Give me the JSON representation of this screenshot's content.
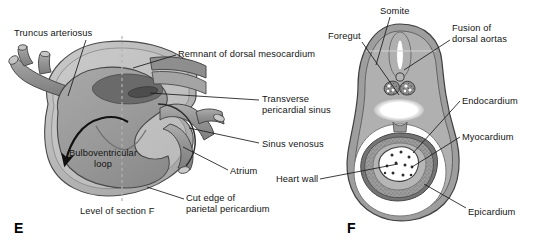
{
  "figure": {
    "background_color": "#ffffff",
    "width": 543,
    "height": 251
  },
  "palette": {
    "outline": "#3b3b3b",
    "leader_line": "#1a1a1a",
    "text": "#141414",
    "tissue_mid": "#9a9a9a",
    "tissue_light": "#b9b9b9",
    "tissue_lighter": "#cfcfcf",
    "tissue_dark": "#6e6e6e",
    "tissue_darker": "#5a5a5a",
    "lumen_white": "#ffffff",
    "pericardium_overlay": "#c4c4c4",
    "dashed_axis": "#b0b0b0"
  },
  "panels": [
    {
      "id": "E",
      "letter": "E",
      "x": 14,
      "y": 221
    },
    {
      "id": "F",
      "letter": "F",
      "x": 347,
      "y": 221
    }
  ],
  "labels": [
    {
      "id": "truncus-arteriosus",
      "text": "Truncus arteriosus",
      "x": 14,
      "y": 28,
      "align": "left",
      "panel": "E",
      "leader": [
        [
          86,
          40
        ],
        [
          68,
          96
        ]
      ]
    },
    {
      "id": "remnant-of-dorsal-mesocardium",
      "text": "Remnant of dorsal mesocardium",
      "x": 178,
      "y": 49,
      "align": "left",
      "panel": "E",
      "leader": [
        [
          176,
          55
        ],
        [
          133,
          68
        ]
      ]
    },
    {
      "id": "transverse-pericardial-sinus",
      "text": "Transverse\npericardial sinus",
      "x": 262,
      "y": 94,
      "align": "left",
      "panel": "E",
      "leader": [
        [
          259,
          100
        ],
        [
          150,
          93
        ]
      ]
    },
    {
      "id": "sinus-venosus",
      "text": "Sinus venosus",
      "x": 262,
      "y": 139,
      "align": "left",
      "panel": "E",
      "leader": [
        [
          259,
          143
        ],
        [
          189,
          128
        ]
      ]
    },
    {
      "id": "atrium",
      "text": "Atrium",
      "x": 230,
      "y": 166,
      "align": "left",
      "panel": "E",
      "leader": [
        [
          228,
          170
        ],
        [
          183,
          147
        ]
      ]
    },
    {
      "id": "cut-edge-of-parietal-pericardium",
      "text": "Cut edge of\nparietal pericardium",
      "x": 186,
      "y": 193,
      "align": "left",
      "panel": "E",
      "leader": [
        [
          184,
          199
        ],
        [
          147,
          187
        ]
      ]
    },
    {
      "id": "bulboventricular-loop",
      "text": "Bulboventricular\nloop",
      "x": 68,
      "y": 148,
      "align": "left",
      "panel": "E",
      "leader": null
    },
    {
      "id": "level-of-section-f",
      "text": "Level of section F",
      "x": 80,
      "y": 206,
      "align": "left",
      "panel": "E",
      "leader": null
    },
    {
      "id": "somite",
      "text": "Somite",
      "x": 380,
      "y": 6,
      "align": "left",
      "panel": "F",
      "leader": [
        [
          390,
          17
        ],
        [
          376,
          65
        ]
      ]
    },
    {
      "id": "foregut",
      "text": "Foregut",
      "x": 328,
      "y": 31,
      "align": "left",
      "panel": "F",
      "leader": [
        [
          362,
          42
        ],
        [
          399,
          95
        ]
      ]
    },
    {
      "id": "fusion-of-dorsal-aortas",
      "text": "Fusion of\ndorsal aortas",
      "x": 452,
      "y": 23,
      "align": "left",
      "panel": "F",
      "leader": [
        [
          450,
          40
        ],
        [
          404,
          70
        ]
      ]
    },
    {
      "id": "endocardium",
      "text": "Endocardium",
      "x": 462,
      "y": 96,
      "align": "left",
      "panel": "F",
      "leader": [
        [
          460,
          101
        ],
        [
          413,
          153
        ]
      ]
    },
    {
      "id": "myocardium",
      "text": "Myocardium",
      "x": 462,
      "y": 132,
      "align": "left",
      "panel": "F",
      "leader": [
        [
          460,
          137
        ],
        [
          412,
          167
        ]
      ]
    },
    {
      "id": "heart-wall",
      "text": "Heart wall",
      "x": 276,
      "y": 174,
      "align": "left",
      "panel": "F",
      "leader": [
        [
          320,
          179
        ],
        [
          398,
          164
        ]
      ]
    },
    {
      "id": "epicardium",
      "text": "Epicardium",
      "x": 468,
      "y": 207,
      "align": "left",
      "panel": "F",
      "leader": [
        [
          466,
          208
        ],
        [
          424,
          184
        ]
      ]
    }
  ],
  "panel_e_structures": [
    {
      "id": "pericardial-sac",
      "description": "outer pericardial sac, light translucent gray"
    },
    {
      "id": "truncus-arteriosus-tube",
      "description": "branching arterial trunk at upper left"
    },
    {
      "id": "bulboventricular-loop-body",
      "description": "large looped ventricular mass, mid gray"
    },
    {
      "id": "dorsal-mesocardium-remnant",
      "description": "dark ellipse dorsal attachment"
    },
    {
      "id": "sinus-venosus-tube",
      "description": "venous inflow tube right side"
    },
    {
      "id": "atrium-body",
      "description": "atrial chamber right"
    },
    {
      "id": "looping-arrow",
      "description": "curved black arrow showing direction of looping"
    },
    {
      "id": "section-axis",
      "description": "vertical dashed line marking level of section F"
    }
  ],
  "panel_f_structures": [
    {
      "id": "neural-tube",
      "description": "white elongated slit at dorsal midline"
    },
    {
      "id": "somite-pair",
      "description": "two stippled somite blocks flanking midline"
    },
    {
      "id": "dorsal-aorta-fused",
      "description": "small circle above somites"
    },
    {
      "id": "foregut-lumen",
      "description": "white oval lumen below somites"
    },
    {
      "id": "pericardial-cavity",
      "description": "white ring cavity around heart tube"
    },
    {
      "id": "myocardium-ring",
      "description": "stippled thick ring around endocardial lumen"
    },
    {
      "id": "endocardium-lumen",
      "description": "white irregular lumen with dark specks at center"
    },
    {
      "id": "epicardium-layer",
      "description": "thin dark outer layer of heart wall"
    },
    {
      "id": "body-wall",
      "description": "outer embryo body wall, pear-shaped outline"
    }
  ]
}
